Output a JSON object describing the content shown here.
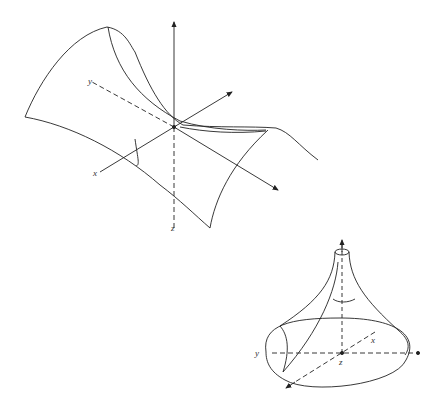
{
  "figures": [
    {
      "name": "saddle-surface",
      "labels": {
        "x": "x",
        "y": "y",
        "z": "z"
      }
    },
    {
      "name": "pseudosphere-surface",
      "labels": {
        "x": "x",
        "y": "y",
        "z": "z"
      }
    }
  ],
  "colors": {
    "line": "#222222",
    "background": "#ffffff"
  }
}
